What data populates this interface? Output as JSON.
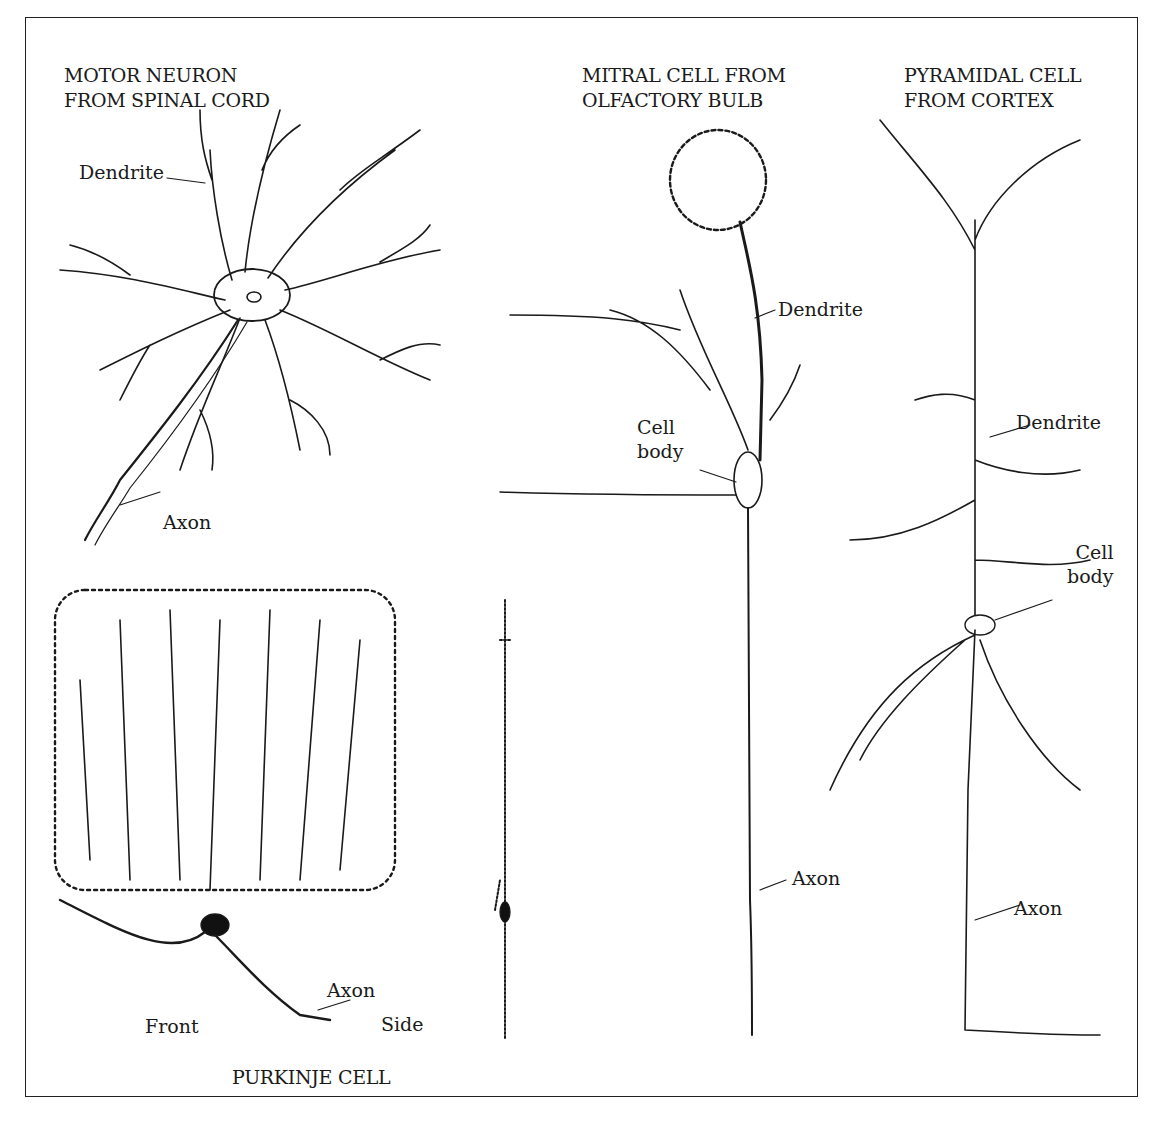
{
  "figure": {
    "panels": [
      {
        "id": "motor",
        "title_lines": [
          "MOTOR NEURON",
          "FROM SPINAL CORD"
        ],
        "labels": {
          "dendrite": "Dendrite",
          "axon": "Axon"
        }
      },
      {
        "id": "mitral",
        "title_lines": [
          "MITRAL CELL FROM",
          "OLFACTORY BULB"
        ],
        "labels": {
          "dendrite": "Dendrite",
          "cell_body_1": "Cell",
          "cell_body_2": "body",
          "axon": "Axon"
        }
      },
      {
        "id": "pyramidal",
        "title_lines": [
          "PYRAMIDAL CELL",
          "FROM CORTEX"
        ],
        "labels": {
          "dendrite": "Dendrite",
          "cell_body_1": "Cell",
          "cell_body_2": "body",
          "axon": "Axon"
        }
      },
      {
        "id": "purkinje",
        "title": "PURKINJE CELL",
        "labels": {
          "front": "Front",
          "side": "Side",
          "axon": "Axon"
        }
      }
    ],
    "colors": {
      "ink": "#1a1a1a",
      "background": "#ffffff"
    }
  }
}
